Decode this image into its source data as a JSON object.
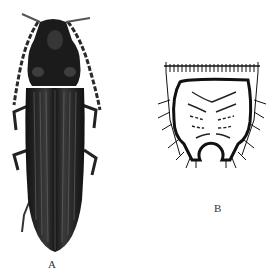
{
  "figure": {
    "panels": [
      {
        "id": "A",
        "label": "A",
        "description": "Dorsal view photograph of an elongate dark click beetle with long serrate antennae and striated elytra"
      },
      {
        "id": "B",
        "label": "B",
        "description": "Line drawing of a larval abdominal segment with fringed anterior margin, curved setae, and a notched posterior opening"
      }
    ],
    "colors": {
      "beetle": "#1c1c1c",
      "ink": "#111111",
      "background": "#ffffff"
    }
  }
}
